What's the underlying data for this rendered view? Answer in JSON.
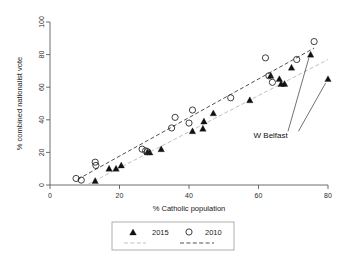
{
  "chart_data": {
    "type": "scatter",
    "title": "",
    "xlabel": "% Catholic population",
    "ylabel": "% combined nationalist vote",
    "xlim": [
      0,
      80
    ],
    "ylim": [
      0,
      100
    ],
    "xticks": [
      0,
      20,
      40,
      60,
      80
    ],
    "yticks": [
      0,
      20,
      40,
      60,
      80,
      100
    ],
    "grid": false,
    "legend_position": "below-outside",
    "series": [
      {
        "name": "2015",
        "marker": "filled-triangle",
        "color": "#111111",
        "points": [
          {
            "x": 13,
            "y": 2.5
          },
          {
            "x": 17,
            "y": 10
          },
          {
            "x": 19,
            "y": 10
          },
          {
            "x": 20.5,
            "y": 12
          },
          {
            "x": 28,
            "y": 20
          },
          {
            "x": 28.7,
            "y": 20
          },
          {
            "x": 32,
            "y": 22
          },
          {
            "x": 41,
            "y": 33
          },
          {
            "x": 44,
            "y": 34.5
          },
          {
            "x": 44.3,
            "y": 39
          },
          {
            "x": 47,
            "y": 44
          },
          {
            "x": 57.5,
            "y": 52
          },
          {
            "x": 63.5,
            "y": 67
          },
          {
            "x": 66,
            "y": 65
          },
          {
            "x": 66.5,
            "y": 62
          },
          {
            "x": 67.5,
            "y": 62
          },
          {
            "x": 69.5,
            "y": 72
          },
          {
            "x": 75,
            "y": 80
          },
          {
            "x": 80,
            "y": 65
          }
        ]
      },
      {
        "name": "2010",
        "marker": "open-circle",
        "color": "#2a2a2a",
        "points": [
          {
            "x": 7.5,
            "y": 4
          },
          {
            "x": 9,
            "y": 3
          },
          {
            "x": 13,
            "y": 14
          },
          {
            "x": 13.2,
            "y": 12
          },
          {
            "x": 26.5,
            "y": 22
          },
          {
            "x": 27.5,
            "y": 21
          },
          {
            "x": 28,
            "y": 20.5
          },
          {
            "x": 35,
            "y": 35
          },
          {
            "x": 36,
            "y": 41.5
          },
          {
            "x": 40,
            "y": 38
          },
          {
            "x": 41,
            "y": 46
          },
          {
            "x": 52,
            "y": 53.5
          },
          {
            "x": 62,
            "y": 78
          },
          {
            "x": 63,
            "y": 67
          },
          {
            "x": 64,
            "y": 63
          },
          {
            "x": 71,
            "y": 77
          },
          {
            "x": 76,
            "y": 88
          }
        ]
      }
    ],
    "fit_lines": [
      {
        "name": "2010 fit",
        "style": "dashed",
        "color": "#3d3d3d",
        "x0": 8,
        "y0": 3.5,
        "x1": 76,
        "y1": 84
      },
      {
        "name": "2015 fit",
        "style": "dashed",
        "color": "#b9b9b9",
        "x0": 11,
        "y0": 0.5,
        "x1": 80,
        "y1": 77
      }
    ],
    "annotations": [
      {
        "label": "W Belfast",
        "label_x": 63.5,
        "label_y": 29,
        "arrows": [
          {
            "from_x": 68.5,
            "from_y": 33,
            "to_x": 74.5,
            "to_y": 78
          },
          {
            "from_x": 71.5,
            "from_y": 33,
            "to_x": 79.3,
            "to_y": 62.5
          }
        ]
      }
    ],
    "legend": {
      "entries": [
        {
          "label": "2015",
          "marker": "filled-triangle"
        },
        {
          "label": "2010",
          "marker": "open-circle"
        }
      ],
      "line_entries": [
        {
          "label": "",
          "style": "dashed",
          "color": "#b9b9b9"
        },
        {
          "label": "",
          "style": "dashed",
          "color": "#3d3d3d"
        }
      ]
    }
  },
  "axis": {
    "x_tick_labels": [
      "0",
      "20",
      "40",
      "60",
      "80"
    ],
    "y_tick_labels": [
      "0",
      "20",
      "40",
      "60",
      "80",
      "100"
    ],
    "x_title": "% Catholic population",
    "y_title": "% combined nationalist vote"
  },
  "annotation": {
    "w_belfast": "W Belfast"
  },
  "legend": {
    "item_2015": "2015",
    "item_2010": "2010"
  }
}
